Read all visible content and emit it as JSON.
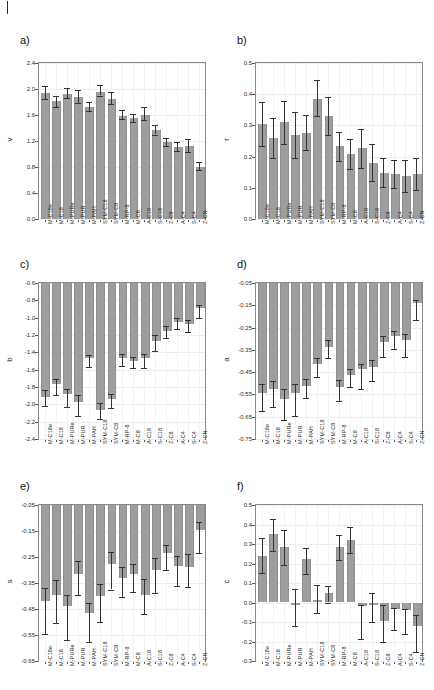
{
  "figure": {
    "top_crumb": "",
    "categories": [
      "M-C18e",
      "M-C18",
      "M-PURe",
      "M-PUR",
      "M-PAH",
      "SYM-C18",
      "SYM-C8",
      "M-RP-8",
      "M-C8",
      "A-C18",
      "S-C18",
      "Z-C8",
      "A-C4",
      "S-C4",
      "Z-CN"
    ]
  },
  "panels": [
    {
      "letter": "a)",
      "ylabel": "v"
    },
    {
      "letter": "b)",
      "ylabel": "r"
    },
    {
      "letter": "c)",
      "ylabel": "b"
    },
    {
      "letter": "d)",
      "ylabel": "a"
    },
    {
      "letter": "e)",
      "ylabel": "s"
    },
    {
      "letter": "f)",
      "ylabel": "c"
    }
  ],
  "chart_data": [
    {
      "type": "bar",
      "panel": "a)",
      "title": "",
      "xlabel": "",
      "ylabel": "v",
      "ylim": [
        0.0,
        2.4
      ],
      "yticks": [
        "0.0",
        "0.4",
        "0.8",
        "1.2",
        "1.6",
        "2.0",
        "2.4"
      ],
      "ytick_values": [
        0.0,
        0.4,
        0.8,
        1.2,
        1.6,
        2.0,
        2.4
      ],
      "grid": true,
      "baseline": 0.0,
      "legend": "none",
      "categories": [
        "M-C18e",
        "M-C18",
        "M-PURe",
        "M-PUR",
        "M-PAH",
        "SYM-C18",
        "SYM-C8",
        "M-RP-8",
        "M-C8",
        "A-C18",
        "S-C18",
        "Z-C8",
        "A-C4",
        "S-C4",
        "Z-CN"
      ],
      "values": [
        1.94,
        1.81,
        1.93,
        1.88,
        1.72,
        1.96,
        1.85,
        1.59,
        1.55,
        1.6,
        1.37,
        1.18,
        1.11,
        1.12,
        0.8
      ],
      "err_low": [
        1.85,
        1.73,
        1.86,
        1.78,
        1.66,
        1.9,
        1.77,
        1.54,
        1.49,
        1.52,
        1.3,
        1.13,
        1.04,
        1.03,
        0.75
      ],
      "err_high": [
        2.05,
        1.9,
        2.02,
        1.98,
        1.8,
        2.06,
        1.95,
        1.67,
        1.62,
        1.72,
        1.44,
        1.25,
        1.18,
        1.23,
        0.88
      ]
    },
    {
      "type": "bar",
      "panel": "b)",
      "title": "",
      "xlabel": "",
      "ylabel": "r",
      "ylim": [
        0.0,
        0.5
      ],
      "yticks": [
        "0.0",
        "0.1",
        "0.2",
        "0.3",
        "0.4",
        "0.5"
      ],
      "ytick_values": [
        0.0,
        0.1,
        0.2,
        0.3,
        0.4,
        0.5
      ],
      "grid": true,
      "baseline": 0.0,
      "legend": "none",
      "categories": [
        "M-C18e",
        "M-C18",
        "M-PURe",
        "M-PUR",
        "M-PAH",
        "SYM-C18",
        "SYM-C8",
        "M-RP-8",
        "M-C8",
        "A-C18",
        "S-C18",
        "Z-C8",
        "A-C4",
        "S-C4",
        "Z-CN"
      ],
      "values": [
        0.303,
        0.259,
        0.31,
        0.269,
        0.277,
        0.385,
        0.33,
        0.233,
        0.209,
        0.226,
        0.181,
        0.148,
        0.144,
        0.138,
        0.144
      ],
      "err_low": [
        0.233,
        0.195,
        0.241,
        0.195,
        0.221,
        0.331,
        0.27,
        0.185,
        0.161,
        0.162,
        0.123,
        0.101,
        0.098,
        0.087,
        0.092
      ],
      "err_high": [
        0.374,
        0.323,
        0.378,
        0.343,
        0.334,
        0.446,
        0.391,
        0.28,
        0.256,
        0.29,
        0.239,
        0.195,
        0.19,
        0.189,
        0.196
      ]
    },
    {
      "type": "bar",
      "panel": "c)",
      "title": "",
      "xlabel": "",
      "ylabel": "b",
      "ylim": [
        -2.4,
        -0.6
      ],
      "yticks": [
        "-0.6",
        "-0.8",
        "-1.0",
        "-1.2",
        "-1.4",
        "-1.6",
        "-1.8",
        "-2.0",
        "-2.2",
        "-2.4"
      ],
      "ytick_values": [
        -0.6,
        -0.8,
        -1.0,
        -1.2,
        -1.4,
        -1.6,
        -1.8,
        -2.0,
        -2.2,
        -2.4
      ],
      "grid": true,
      "baseline": -0.6,
      "legend": "none",
      "categories": [
        "M-C18e",
        "M-C18",
        "M-PURe",
        "M-PUR",
        "M-PAH",
        "SYM-C18",
        "SYM-C8",
        "M-RP-8",
        "M-C8",
        "A-C18",
        "S-C18",
        "Z-C8",
        "A-C4",
        "S-C4",
        "Z-CN"
      ],
      "values": [
        -1.91,
        -1.77,
        -1.88,
        -1.97,
        -1.47,
        -2.06,
        -1.94,
        -1.47,
        -1.5,
        -1.47,
        -1.27,
        -1.15,
        -1.05,
        -1.07,
        -0.89
      ],
      "err_low": [
        -2.02,
        -1.89,
        -2.03,
        -2.14,
        -1.57,
        -2.17,
        -2.04,
        -1.56,
        -1.58,
        -1.58,
        -1.38,
        -1.23,
        -1.13,
        -1.17,
        -1.0
      ],
      "err_high": [
        -1.83,
        -1.71,
        -1.82,
        -1.89,
        -1.43,
        -1.99,
        -1.88,
        -1.42,
        -1.45,
        -1.42,
        -1.2,
        -1.1,
        -1.0,
        -1.03,
        -0.85
      ]
    },
    {
      "type": "bar",
      "panel": "d)",
      "title": "",
      "xlabel": "",
      "ylabel": "a",
      "ylim": [
        -0.75,
        -0.05
      ],
      "yticks": [
        "-0.05",
        "-0.15",
        "-0.25",
        "-0.35",
        "-0.45",
        "-0.55",
        "-0.65",
        "-0.75"
      ],
      "ytick_values": [
        -0.05,
        -0.15,
        -0.25,
        -0.35,
        -0.45,
        -0.55,
        -0.65,
        -0.75
      ],
      "grid": true,
      "baseline": -0.05,
      "legend": "none",
      "categories": [
        "M-C18e",
        "M-C18",
        "M-PURe",
        "M-PUR",
        "M-PAH",
        "SYM-C18",
        "SYM-C8",
        "M-RP-8",
        "M-C8",
        "A-C18",
        "S-C18",
        "Z-C8",
        "A-C4",
        "S-C4",
        "Z-CN"
      ],
      "values": [
        -0.545,
        -0.525,
        -0.57,
        -0.545,
        -0.51,
        -0.415,
        -0.335,
        -0.515,
        -0.465,
        -0.435,
        -0.425,
        -0.315,
        -0.29,
        -0.305,
        -0.14
      ],
      "err_low": [
        -0.625,
        -0.605,
        -0.665,
        -0.645,
        -0.565,
        -0.47,
        -0.385,
        -0.58,
        -0.515,
        -0.525,
        -0.49,
        -0.38,
        -0.345,
        -0.38,
        -0.215
      ],
      "err_high": [
        -0.505,
        -0.49,
        -0.525,
        -0.505,
        -0.48,
        -0.385,
        -0.305,
        -0.485,
        -0.435,
        -0.415,
        -0.395,
        -0.29,
        -0.265,
        -0.28,
        -0.125
      ]
    },
    {
      "type": "bar",
      "panel": "e)",
      "title": "",
      "xlabel": "",
      "ylabel": "s",
      "ylim": [
        -0.65,
        -0.05
      ],
      "yticks": [
        "-0.05",
        "-0.15",
        "-0.25",
        "-0.35",
        "-0.45",
        "-0.55",
        "-0.65"
      ],
      "ytick_values": [
        -0.05,
        -0.15,
        -0.25,
        -0.35,
        -0.45,
        -0.55,
        -0.65
      ],
      "grid": true,
      "baseline": -0.05,
      "legend": "none",
      "categories": [
        "M-C18e",
        "M-C18",
        "M-PURe",
        "M-PUR",
        "M-PAH",
        "SYM-C18",
        "SYM-C8",
        "M-RP-8",
        "M-C8",
        "A-C18",
        "S-C18",
        "Z-C8",
        "A-C4",
        "S-C4",
        "Z-CN"
      ],
      "values": [
        -0.42,
        -0.395,
        -0.44,
        -0.315,
        -0.465,
        -0.4,
        -0.275,
        -0.33,
        -0.315,
        -0.395,
        -0.3,
        -0.235,
        -0.285,
        -0.29,
        -0.145
      ],
      "err_low": [
        -0.545,
        -0.505,
        -0.57,
        -0.395,
        -0.575,
        -0.5,
        -0.375,
        -0.405,
        -0.385,
        -0.47,
        -0.39,
        -0.3,
        -0.36,
        -0.365,
        -0.235
      ],
      "err_high": [
        -0.37,
        -0.34,
        -0.395,
        -0.265,
        -0.425,
        -0.355,
        -0.23,
        -0.29,
        -0.275,
        -0.335,
        -0.255,
        -0.205,
        -0.245,
        -0.24,
        -0.115
      ]
    },
    {
      "type": "bar",
      "panel": "f)",
      "title": "",
      "xlabel": "",
      "ylabel": "c",
      "ylim": [
        -0.3,
        0.5
      ],
      "yticks": [
        "-0.3",
        "-0.2",
        "-0.1",
        "0.0",
        "0.1",
        "0.2",
        "0.3",
        "0.4",
        "0.5"
      ],
      "ytick_values": [
        -0.3,
        -0.2,
        -0.1,
        0.0,
        0.1,
        0.2,
        0.3,
        0.4,
        0.5
      ],
      "grid": true,
      "baseline": 0.0,
      "legend": "none",
      "categories": [
        "M-C18e",
        "M-C18",
        "M-PURe",
        "M-PUR",
        "M-PAH",
        "SYM-C18",
        "SYM-C8",
        "M-RP-8",
        "M-C8",
        "A-C18",
        "S-C18",
        "Z-C8",
        "A-C4",
        "S-C4",
        "Z-CN"
      ],
      "values": [
        0.241,
        0.352,
        0.283,
        -0.014,
        0.222,
        0.013,
        0.047,
        0.286,
        0.32,
        -0.019,
        -0.015,
        -0.094,
        -0.032,
        -0.037,
        -0.118
      ],
      "err_low": [
        0.152,
        0.262,
        0.19,
        -0.12,
        0.148,
        -0.056,
        0.0,
        0.22,
        0.256,
        -0.186,
        -0.1,
        -0.205,
        -0.14,
        -0.16,
        -0.255
      ],
      "err_high": [
        0.33,
        0.43,
        0.372,
        0.068,
        0.282,
        0.092,
        0.083,
        0.344,
        0.385,
        -0.015,
        0.047,
        -0.012,
        -0.028,
        -0.033,
        -0.062
      ]
    }
  ]
}
